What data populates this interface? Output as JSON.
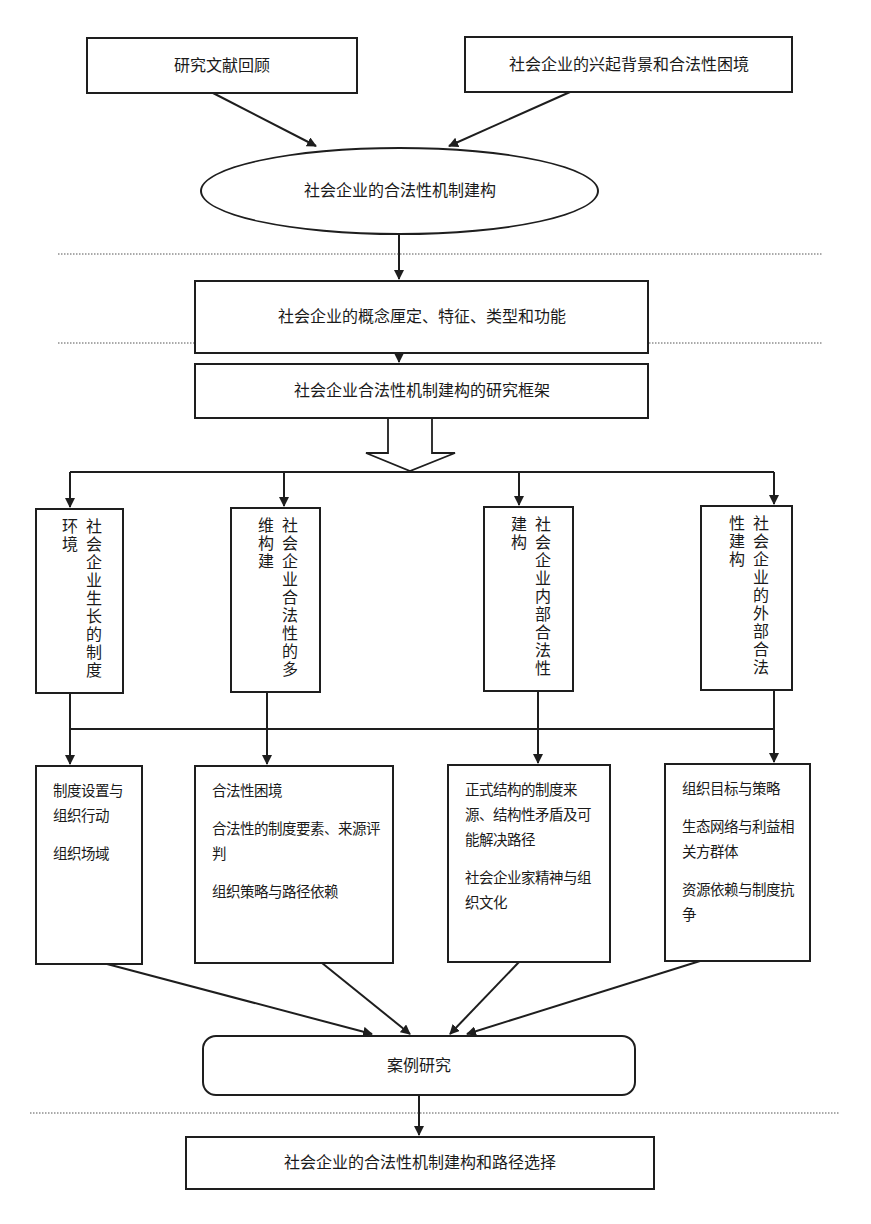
{
  "diagram": {
    "type": "research-framework-flowchart",
    "top_inputs": [
      {
        "id": "literature",
        "label": "研究文献回顾"
      },
      {
        "id": "background",
        "label": "社会企业的兴起背景和合法性困境"
      }
    ],
    "core": {
      "id": "core",
      "shape": "ellipse",
      "label": "社会企业的合法性机制建构"
    },
    "concept": {
      "id": "concept",
      "label": "社会企业的概念厘定、特征、类型和功能"
    },
    "framework": {
      "id": "framework",
      "label": "社会企业合法性机制建构的研究框架"
    },
    "dimensions": [
      {
        "id": "dim1",
        "label": "社会企业生长的制度环境"
      },
      {
        "id": "dim2",
        "label": "社会企业合法性的多维构建"
      },
      {
        "id": "dim3",
        "label": "社会企业内部合法性建构"
      },
      {
        "id": "dim4",
        "label": "社会企业的外部合法性建构"
      }
    ],
    "details": [
      {
        "id": "det1",
        "items": [
          "制度设置与组织行动",
          "组织场域"
        ]
      },
      {
        "id": "det2",
        "items": [
          "合法性困境",
          "合法性的制度要素、来源评判",
          "组织策略与路径依赖"
        ]
      },
      {
        "id": "det3",
        "items": [
          "正式结构的制度来源、结构性矛盾及可能解决路径",
          "社会企业家精神与组织文化"
        ]
      },
      {
        "id": "det4",
        "items": [
          "组织目标与策略",
          "生态网络与利益相关方群体",
          "资源依赖与制度抗争"
        ]
      }
    ],
    "case_study": {
      "id": "case",
      "shape": "rounded-rectangle",
      "label": "案例研究"
    },
    "conclusion": {
      "id": "conclusion",
      "label": "社会企业的合法性机制建构和路径选择"
    },
    "edges": [
      [
        "literature",
        "core"
      ],
      [
        "background",
        "core"
      ],
      [
        "core",
        "concept"
      ],
      [
        "concept",
        "framework"
      ],
      [
        "framework",
        "dim1"
      ],
      [
        "framework",
        "dim2"
      ],
      [
        "framework",
        "dim3"
      ],
      [
        "framework",
        "dim4"
      ],
      [
        "dim1",
        "det1"
      ],
      [
        "dim2",
        "det2"
      ],
      [
        "dim3",
        "det3"
      ],
      [
        "dim4",
        "det4"
      ],
      [
        "det1",
        "case"
      ],
      [
        "det2",
        "case"
      ],
      [
        "det3",
        "case"
      ],
      [
        "det4",
        "case"
      ],
      [
        "case",
        "conclusion"
      ]
    ],
    "section_dividers": 3
  }
}
